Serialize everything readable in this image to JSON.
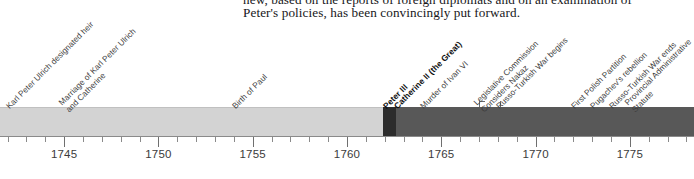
{
  "document_text": {
    "line_1": "new, based on the reports of foreign diplomats and on an examination of",
    "line_2": "Peter's policies, has been convincingly put forward."
  },
  "chart_data": {
    "type": "timeline",
    "title": "",
    "xlabel": "",
    "ylabel": "",
    "xlim": [
      1741.6,
      1778.4
    ],
    "grid": false,
    "legend": "none",
    "axis": {
      "major_tick_labels": [
        "1745",
        "1750",
        "1755",
        "1760",
        "1765",
        "1770",
        "1775"
      ],
      "major_tick_values": [
        1745,
        1750,
        1755,
        1760,
        1765,
        1770,
        1775
      ],
      "minor_tick_interval": 1,
      "minor_tick_start": 1742,
      "minor_tick_end": 1778
    },
    "reign_bars": [
      {
        "name": "Elizabeth",
        "label": "",
        "start": 1741.6,
        "end": 1761.9,
        "color": "#d3d3d3"
      },
      {
        "name": "Peter III",
        "label": "Peter III",
        "start": 1761.9,
        "end": 1762.6,
        "color": "#2c2c2c"
      },
      {
        "name": "Catherine II",
        "label": "Catherine II (the Great)",
        "start": 1762.6,
        "end": 1778.4,
        "color": "#585858"
      }
    ],
    "events": [
      {
        "label": "Karl Peter Ulrich designated heir",
        "year": 1742,
        "bold": false,
        "lines": [
          "Karl Peter Ulrich designated heir"
        ]
      },
      {
        "label": "Marriage of Karl Peter Ulrich and Catherine",
        "year": 1745,
        "bold": false,
        "lines": [
          "Marriage of Karl Peter Ulrich",
          "and Catherine"
        ]
      },
      {
        "label": "Birth of Paul",
        "year": 1754,
        "bold": false,
        "lines": [
          "Birth of Paul"
        ]
      },
      {
        "label": "Peter III",
        "year": 1762,
        "bold": true,
        "lines": [
          "Peter III"
        ]
      },
      {
        "label": "Catherine II (the Great)",
        "year": 1762.6,
        "bold": true,
        "lines": [
          "Catherine II (the Great)"
        ]
      },
      {
        "label": "Murder of Ivan VI",
        "year": 1764,
        "bold": false,
        "lines": [
          "Murder of Ivan VI"
        ]
      },
      {
        "label": "Legislative Commission Considers Nakaz",
        "year": 1767,
        "bold": false,
        "lines": [
          "Legislative Commission",
          "Considers Nakaz"
        ]
      },
      {
        "label": "Russo-Turkish War begins",
        "year": 1768,
        "bold": false,
        "lines": [
          "Russo-Turkish War begins"
        ]
      },
      {
        "label": "First Polish Partition",
        "year": 1772,
        "bold": false,
        "lines": [
          "First Polish Partition"
        ]
      },
      {
        "label": "Pugachev's rebellion",
        "year": 1773,
        "bold": false,
        "lines": [
          "Pugachev's rebellion"
        ]
      },
      {
        "label": "Russo-Turkish War ends",
        "year": 1774,
        "bold": false,
        "lines": [
          "Russo-Turkish War ends"
        ]
      },
      {
        "label": "Provincial Administrative Statute",
        "year": 1775,
        "bold": false,
        "lines": [
          "Provincial Administrative",
          "Statute"
        ]
      }
    ]
  }
}
